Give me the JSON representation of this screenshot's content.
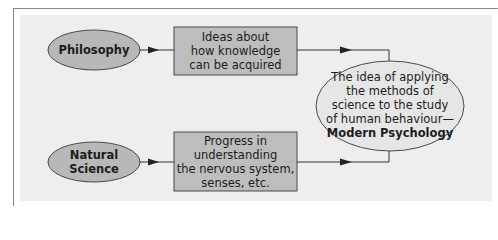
{
  "diagram": {
    "colors": {
      "panel_bg": "#eeeeee",
      "frame_line": "#8a8a8a",
      "small_ellipse_fill": "#b8b8b8",
      "box_fill": "#bdbdbd",
      "big_ellipse_fill": "#e6e6e6",
      "stroke": "#4a4a4a",
      "text": "#1c1c1c"
    },
    "nodes": {
      "philosophy": {
        "shape": "ellipse",
        "lines": [
          "Philosophy"
        ]
      },
      "natural_science": {
        "shape": "ellipse",
        "lines": [
          "Natural",
          "Science"
        ]
      },
      "ideas_box": {
        "shape": "rectangle",
        "lines": [
          "Ideas about",
          "how knowledge",
          "can be acquired"
        ]
      },
      "progress_box": {
        "shape": "rectangle",
        "lines": [
          "Progress in",
          "understanding",
          "the nervous system,",
          "senses, etc."
        ]
      },
      "modern_psychology": {
        "shape": "ellipse",
        "lines": [
          "The idea of applying",
          "the methods of",
          "science to the study",
          "of human behaviour—"
        ],
        "emphasis": "Modern Psychology"
      }
    },
    "edges": [
      {
        "from": "philosophy",
        "to": "ideas_box"
      },
      {
        "from": "natural_science",
        "to": "progress_box"
      },
      {
        "from": "ideas_box",
        "to": "modern_psychology"
      },
      {
        "from": "progress_box",
        "to": "modern_psychology"
      }
    ]
  }
}
